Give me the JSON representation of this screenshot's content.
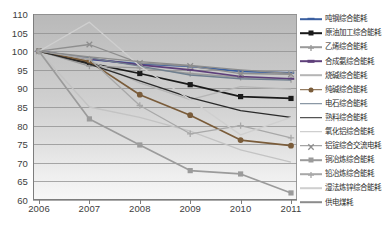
{
  "chart_data": {
    "type": "line",
    "title": "",
    "xlabel": "",
    "ylabel": "",
    "x": [
      "2006",
      "2007",
      "2008",
      "2009",
      "2010",
      "2011"
    ],
    "ylim": [
      60,
      110
    ],
    "yticks": [
      60,
      65,
      70,
      75,
      80,
      85,
      90,
      95,
      100,
      105,
      110
    ],
    "grid": true,
    "legend_position": "right",
    "series": [
      {
        "name": "吨钢综合能耗",
        "color": "#3a5fa0",
        "marker": "dash",
        "values": [
          100,
          97.8,
          96.6,
          95.9,
          94.6,
          94.2
        ]
      },
      {
        "name": "原油加工综合能耗",
        "color": "#1a1a1a",
        "marker": "square",
        "values": [
          100,
          96.8,
          94.0,
          91.0,
          87.8,
          87.3
        ]
      },
      {
        "name": "乙烯综合能耗",
        "color": "#9a9a9a",
        "marker": "plus",
        "values": [
          100,
          96.0,
          95.5,
          94.0,
          93.0,
          92.4
        ]
      },
      {
        "name": "合成氨综合能耗",
        "color": "#5e3f7a",
        "marker": "dash",
        "values": [
          100,
          98.0,
          96.3,
          95.0,
          93.2,
          92.6
        ]
      },
      {
        "name": "烧碱综合能耗",
        "color": "#b5b5b5",
        "marker": "line",
        "values": [
          100,
          97.5,
          91.5,
          87.0,
          90.5,
          89.8
        ]
      },
      {
        "name": "纯碱综合能耗",
        "color": "#7a5c3a",
        "marker": "circle",
        "values": [
          100,
          97.2,
          88.3,
          82.8,
          76.1,
          74.6
        ]
      },
      {
        "name": "电石综合能耗",
        "color": "#6f7f8f",
        "marker": "line",
        "values": [
          100,
          98.2,
          96.0,
          93.6,
          92.6,
          92.2
        ]
      },
      {
        "name": "熟料综合能耗",
        "color": "#2a2a2a",
        "marker": "line",
        "values": [
          100,
          96.5,
          92.0,
          87.5,
          84.0,
          82.2
        ]
      },
      {
        "name": "氧化铝综合能耗",
        "color": "#c3c3c3",
        "marker": "line",
        "values": [
          100,
          85.0,
          82.2,
          78.5,
          73.5,
          70.2
        ]
      },
      {
        "name": "铝锭综合交流电耗",
        "color": "#8e8e8e",
        "marker": "x",
        "values": [
          100,
          101.8,
          96.8,
          96.0,
          94.0,
          93.8
        ]
      },
      {
        "name": "铜冶炼综合能耗",
        "color": "#9b9b9b",
        "marker": "square",
        "values": [
          100,
          81.8,
          74.8,
          67.9,
          67.0,
          61.9
        ]
      },
      {
        "name": "铅冶炼综合能耗",
        "color": "#a8a8a8",
        "marker": "plus",
        "values": [
          100,
          97.9,
          85.4,
          77.8,
          80.0,
          76.7
        ]
      },
      {
        "name": "湿法炼锌综合能耗",
        "color": "#cfcfcf",
        "marker": "line",
        "values": [
          100,
          107.8,
          96.0,
          87.0,
          77.5,
          82.2
        ]
      },
      {
        "name": "供电煤耗",
        "color": "#8c8c8c",
        "marker": "line",
        "values": [
          100,
          98.5,
          97.2,
          96.2,
          95.0,
          94.0
        ]
      }
    ]
  },
  "legend": {
    "items": [
      {
        "label": "吨钢综合能耗"
      },
      {
        "label": "原油加工综合能耗"
      },
      {
        "label": "乙烯综合能耗"
      },
      {
        "label": "合成氨综合能耗"
      },
      {
        "label": "烧碱综合能耗"
      },
      {
        "label": "纯碱综合能耗"
      },
      {
        "label": "电石综合能耗"
      },
      {
        "label": "熟料综合能耗"
      },
      {
        "label": "氧化铝综合能耗"
      },
      {
        "label": "铝锭综合交流电耗"
      },
      {
        "label": "铜冶炼综合能耗"
      },
      {
        "label": "铅冶炼综合能耗"
      },
      {
        "label": "湿法炼锌综合能耗"
      },
      {
        "label": "供电煤耗"
      }
    ]
  }
}
